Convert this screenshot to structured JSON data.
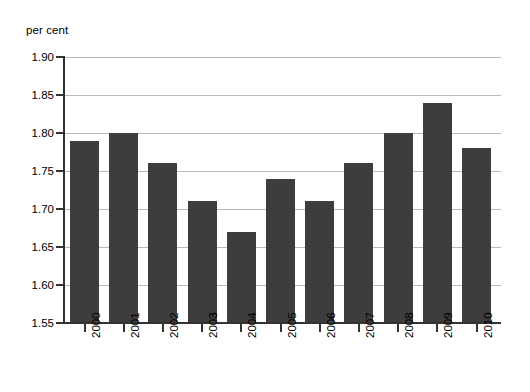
{
  "chart_data": {
    "type": "bar",
    "title": "",
    "subtitle": "",
    "xlabel": "",
    "ylabel": "per cent",
    "categories": [
      "2000",
      "2001",
      "2002",
      "2003",
      "2004",
      "2005",
      "2006",
      "2007",
      "2008",
      "2009",
      "2010"
    ],
    "values": [
      1.79,
      1.8,
      1.76,
      1.71,
      1.67,
      1.74,
      1.71,
      1.76,
      1.8,
      1.84,
      1.78
    ],
    "series": [
      {
        "name": "per cent",
        "values": [
          1.79,
          1.8,
          1.76,
          1.71,
          1.67,
          1.74,
          1.71,
          1.76,
          1.8,
          1.84,
          1.78
        ]
      }
    ],
    "ylim": [
      1.55,
      1.9
    ],
    "ytick_step": 0.05,
    "ytick_labels": [
      "1.90",
      "1.85",
      "1.80",
      "1.75",
      "1.70",
      "1.65",
      "1.60",
      "1.55"
    ],
    "ytick_values": [
      1.9,
      1.85,
      1.8,
      1.75,
      1.7,
      1.65,
      1.6,
      1.55
    ],
    "grid": true,
    "legend": false,
    "legend_position": "none",
    "bar_color": "#3d3d3d",
    "grid_color": "#b9b9b9",
    "axis_color": "#333333",
    "background_color": "#ffffff",
    "xtick_label_rotation": "-90"
  },
  "axis": {
    "unit_caption": "per cent"
  }
}
